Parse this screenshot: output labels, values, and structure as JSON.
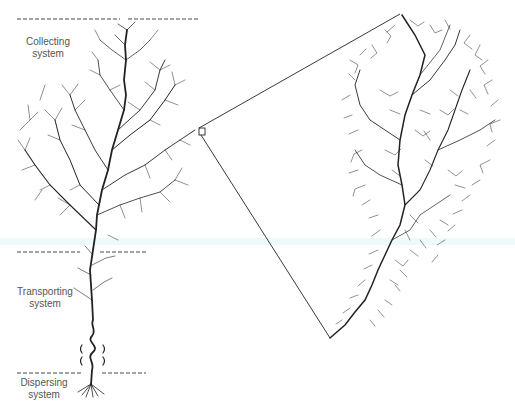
{
  "diagram": {
    "labels": {
      "collecting": [
        "Collecting",
        "system"
      ],
      "transporting": [
        "Transporting",
        "system"
      ],
      "dispersing": [
        "Dispersing",
        "system"
      ]
    },
    "dividers": [
      {
        "name": "top-divider",
        "y": 19
      },
      {
        "name": "collecting-transporting-divider",
        "y": 252
      },
      {
        "name": "transporting-dispersing-divider",
        "y": 373
      }
    ],
    "zoom_box": {
      "x": 199,
      "y": 128,
      "w": 6,
      "h": 7
    },
    "colors": {
      "ink": "#222222",
      "divider": "#333333",
      "label": "#555555",
      "band": "#eef9fb"
    }
  }
}
